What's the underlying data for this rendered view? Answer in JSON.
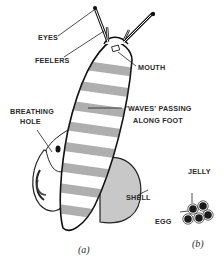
{
  "figure": {
    "part_a": {
      "caption": "(a)",
      "labels": {
        "eyes": "EYES",
        "feelers": "FEELERS",
        "mouth": "MOUTH",
        "breathing_hole_line1": "BREATHING",
        "breathing_hole_line2": "HOLE",
        "waves_line1": "'WAVES' PASSING",
        "waves_line2": "ALONG FOOT",
        "shell": "SHELL"
      }
    },
    "part_b": {
      "caption": "(b)",
      "labels": {
        "jelly": "JELLY",
        "egg": "EGG"
      }
    }
  }
}
